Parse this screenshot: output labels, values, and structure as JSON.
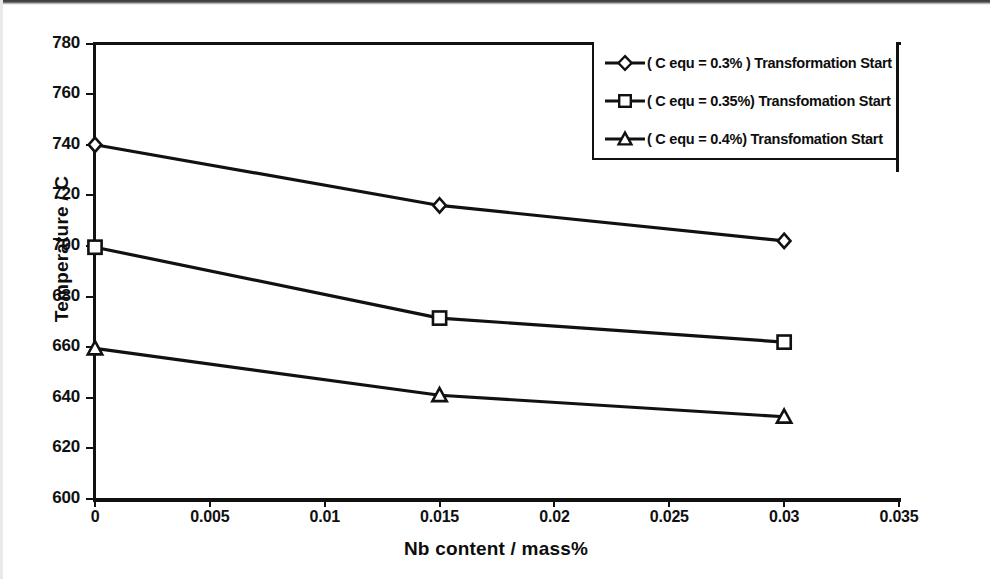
{
  "chart_data": {
    "type": "line",
    "title": "",
    "xlabel": "Nb content / mass%",
    "ylabel": "Temperature / C",
    "xlim": [
      0,
      0.035
    ],
    "ylim": [
      600,
      780
    ],
    "xticks": [
      "0",
      "0.005",
      "0.01",
      "0.015",
      "0.02",
      "0.025",
      "0.03",
      "0.035"
    ],
    "xtick_values": [
      0,
      0.005,
      0.01,
      0.015,
      0.02,
      0.025,
      0.03,
      0.035
    ],
    "yticks": [
      "780",
      "760",
      "740",
      "720",
      "700",
      "680",
      "660",
      "640",
      "620",
      "600"
    ],
    "ytick_values": [
      780,
      760,
      740,
      720,
      700,
      680,
      660,
      640,
      620,
      600
    ],
    "grid": false,
    "legend_position": "top-right inside plot",
    "x": [
      0,
      0.015,
      0.03
    ],
    "series": [
      {
        "name": "( C equ = 0.3% ) Transformation Start",
        "marker": "diamond",
        "color": "#111111",
        "values": [
          740,
          716,
          702
        ]
      },
      {
        "name": "( C equ = 0.35%) Transfomation Start",
        "marker": "square",
        "color": "#111111",
        "values": [
          699.5,
          671.5,
          662
        ]
      },
      {
        "name": "( C equ = 0.4%) Transfomation Start",
        "marker": "triangle",
        "color": "#111111",
        "values": [
          659.5,
          641,
          632.5
        ]
      }
    ]
  },
  "axes": {
    "y_title": "Temperature / C",
    "x_title": "Nb content / mass%",
    "y_tick_labels": [
      "780",
      "760",
      "740",
      "720",
      "700",
      "680",
      "660",
      "640",
      "620",
      "600"
    ],
    "x_tick_labels": [
      "0",
      "0.005",
      "0.01",
      "0.015",
      "0.02",
      "0.025",
      "0.03",
      "0.035"
    ]
  },
  "legend": {
    "entries": [
      {
        "label": "( C equ = 0.3% ) Transformation Start",
        "marker": "diamond"
      },
      {
        "label": "( C equ = 0.35%) Transfomation Start",
        "marker": "square"
      },
      {
        "label": "( C equ = 0.4%) Transfomation Start",
        "marker": "triangle"
      }
    ]
  },
  "colors": {
    "ink": "#111111",
    "paper": "#ffffff"
  }
}
